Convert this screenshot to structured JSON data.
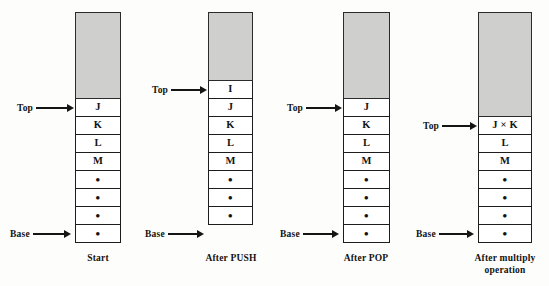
{
  "diagram": {
    "pointer_labels": {
      "top": "Top",
      "base": "Base"
    },
    "colors": {
      "free_space_fill": "#cfd0cd",
      "cell_fill": "#ffffff",
      "stroke": "#1d1d1d",
      "background": "#fdfdfc"
    },
    "dot_symbol": "•",
    "multiply_symbol": "×"
  },
  "stacks": [
    {
      "id": "start",
      "caption": "Start",
      "caption_lines": [
        "Start"
      ],
      "cells": [
        "J",
        "K",
        "L",
        "M",
        "•",
        "•",
        "•",
        "•"
      ],
      "top_index": 0,
      "base_index": 7,
      "free_cells": 4
    },
    {
      "id": "after-push",
      "caption": "After PUSH",
      "caption_lines": [
        "After PUSH"
      ],
      "cells": [
        "I",
        "J",
        "K",
        "L",
        "M",
        "•",
        "•",
        "•"
      ],
      "top_index": 0,
      "base_index": 7,
      "free_cells": 3
    },
    {
      "id": "after-pop",
      "caption": "After POP",
      "caption_lines": [
        "After POP"
      ],
      "cells": [
        "J",
        "K",
        "L",
        "M",
        "•",
        "•",
        "•",
        "•"
      ],
      "top_index": 0,
      "base_index": 7,
      "free_cells": 4
    },
    {
      "id": "after-multiply",
      "caption": "After multiply operation",
      "caption_lines": [
        "After multiply",
        "operation"
      ],
      "cells": [
        "J × K",
        "L",
        "M",
        "•",
        "•",
        "•",
        "•"
      ],
      "top_index": 0,
      "base_index": 6,
      "free_cells": 5
    }
  ]
}
